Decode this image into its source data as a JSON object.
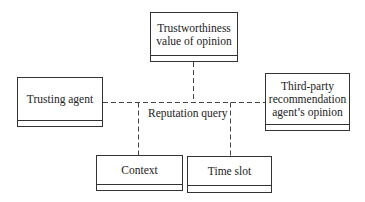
{
  "diagram": {
    "center_label": "Reputation query",
    "boxes": [
      {
        "id": "trustworthiness",
        "label_lines": [
          "Trustworthiness",
          "value of opinion"
        ]
      },
      {
        "id": "trusting-agent",
        "label_lines": [
          "Trusting agent"
        ]
      },
      {
        "id": "third-party",
        "label_lines": [
          "Third-party",
          "recommendation",
          "agent’s opinion"
        ]
      },
      {
        "id": "context",
        "label_lines": [
          "Context"
        ]
      },
      {
        "id": "time-slot",
        "label_lines": [
          "Time slot"
        ]
      }
    ],
    "connectors": [
      {
        "from": "trusting-agent",
        "to": "reputation-query",
        "style": "dashed"
      },
      {
        "from": "trustworthiness",
        "to": "reputation-query",
        "style": "dashed"
      },
      {
        "from": "third-party",
        "to": "reputation-query",
        "style": "dashed"
      },
      {
        "from": "context",
        "to": "reputation-query",
        "style": "dashed"
      },
      {
        "from": "time-slot",
        "to": "reputation-query",
        "style": "dashed"
      }
    ]
  }
}
